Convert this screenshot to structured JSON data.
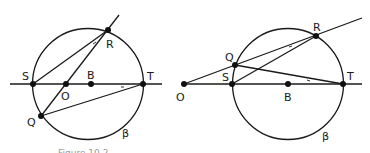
{
  "figures": [
    {
      "id": "left",
      "circle_label": "β",
      "labels": {
        "S": "S",
        "O": "O",
        "B": "B",
        "T": "T",
        "R": "R",
        "Q": "Q"
      },
      "angle_marks": [
        "+",
        "+"
      ]
    },
    {
      "id": "right",
      "circle_label": "β",
      "labels": {
        "S": "S",
        "O": "O",
        "B": "B",
        "T": "T",
        "R": "R",
        "Q": "Q"
      },
      "angle_marks": [
        "+",
        "+"
      ]
    }
  ],
  "caption": "Figure 10.2"
}
